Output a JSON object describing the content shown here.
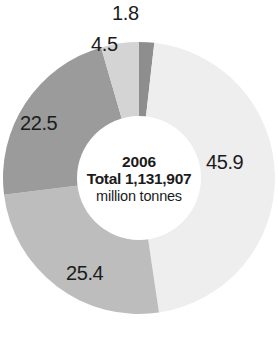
{
  "chart_data": {
    "type": "pie",
    "variant": "donut",
    "title": "",
    "subtitle": "",
    "xlabel": "",
    "ylabel": "",
    "grid": false,
    "legend": "none",
    "data_labels": true,
    "value_unit": "percent",
    "start_angle_deg": 0,
    "direction": "clockwise",
    "center": {
      "year": "2006",
      "total": "Total 1,131,907",
      "units": "million tonnes",
      "total_value": 1131907,
      "total_unit": "million tonnes"
    },
    "categories": [
      "1.8",
      "45.9",
      "25.4",
      "22.5",
      "4.5"
    ],
    "values": [
      1.8,
      45.9,
      25.4,
      22.5,
      4.5
    ],
    "colors": [
      "#8e8e8e",
      "#eeeeee",
      "#bdbdbd",
      "#9b9b9b",
      "#d4d4d4"
    ],
    "slices": [
      {
        "label": "1.8",
        "value": 1.8,
        "color": "#8e8e8e"
      },
      {
        "label": "45.9",
        "value": 45.9,
        "color": "#eeeeee"
      },
      {
        "label": "25.4",
        "value": 25.4,
        "color": "#bdbdbd"
      },
      {
        "label": "22.5",
        "value": 22.5,
        "color": "#9b9b9b"
      },
      {
        "label": "4.5",
        "value": 4.5,
        "color": "#d4d4d4"
      }
    ],
    "labels": {
      "s45_9": "45.9",
      "s25_4": "25.4",
      "s22_5": "22.5",
      "s4_5": "4.5",
      "s1_8": "1.8"
    }
  }
}
